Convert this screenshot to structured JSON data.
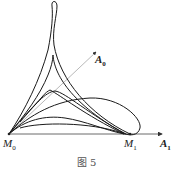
{
  "figure": {
    "caption": "图 5",
    "labels": {
      "M0": {
        "base": "M",
        "sub": "0"
      },
      "M1": {
        "base": "M",
        "sub": "1"
      },
      "A0": {
        "base": "A",
        "sub": "0"
      },
      "A1": {
        "base": "A",
        "sub": "1"
      }
    },
    "colors": {
      "curve": "#1a1a1a",
      "axis": "#444444",
      "ray": "#888888"
    }
  }
}
